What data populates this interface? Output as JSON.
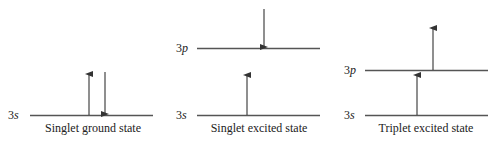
{
  "colors": {
    "line": "#555555",
    "text": "#222222",
    "background": "#ffffff"
  },
  "panels": [
    {
      "caption": "Singlet ground state",
      "levels": [
        {
          "label_num": "3",
          "label_orb": "s"
        }
      ],
      "electrons": [
        {
          "level": "3s",
          "spin": "up"
        },
        {
          "level": "3s",
          "spin": "down"
        }
      ]
    },
    {
      "caption": "Singlet excited state",
      "levels": [
        {
          "label_num": "3",
          "label_orb": "p"
        },
        {
          "label_num": "3",
          "label_orb": "s"
        }
      ],
      "electrons": [
        {
          "level": "3p",
          "spin": "down"
        },
        {
          "level": "3s",
          "spin": "up"
        }
      ]
    },
    {
      "caption": "Triplet excited state",
      "levels": [
        {
          "label_num": "3",
          "label_orb": "p"
        },
        {
          "label_num": "3",
          "label_orb": "s"
        }
      ],
      "electrons": [
        {
          "level": "3p",
          "spin": "up"
        },
        {
          "level": "3s",
          "spin": "up"
        }
      ]
    }
  ]
}
